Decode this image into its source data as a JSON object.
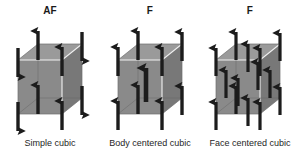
{
  "figure": {
    "background_color": "#ffffff",
    "width": 300,
    "height": 153
  },
  "style": {
    "cube_front_color": "#8a8a8a",
    "cube_side_color": "#787878",
    "cube_top_color": "#9a9a9a",
    "cube_edge_color": "#f2f2f2",
    "arrow_color": "#1c1c1c",
    "text_color": "#262626"
  },
  "cells": [
    {
      "id": "simple-cubic",
      "top_label": "AF",
      "bottom_label": "Simple cubic",
      "ordering": "antiferromagnetic",
      "site_count": 8,
      "sites": [
        {
          "name": "corner-front-bottom-left",
          "x": 18,
          "y": 98,
          "dir": "down",
          "size": "large"
        },
        {
          "name": "corner-front-bottom-right",
          "x": 62,
          "y": 98,
          "dir": "up",
          "size": "large"
        },
        {
          "name": "corner-front-top-left",
          "x": 18,
          "y": 44,
          "dir": "down",
          "size": "large"
        },
        {
          "name": "corner-front-top-right",
          "x": 62,
          "y": 44,
          "dir": "up",
          "size": "large"
        },
        {
          "name": "corner-back-bottom-left",
          "x": 38,
          "y": 82,
          "dir": "up",
          "size": "large"
        },
        {
          "name": "corner-back-bottom-right",
          "x": 82,
          "y": 82,
          "dir": "down",
          "size": "large"
        },
        {
          "name": "corner-back-top-left",
          "x": 38,
          "y": 28,
          "dir": "up",
          "size": "large"
        },
        {
          "name": "corner-back-top-right",
          "x": 82,
          "y": 28,
          "dir": "down",
          "size": "large"
        }
      ]
    },
    {
      "id": "body-centered-cubic",
      "top_label": "F",
      "bottom_label": "Body centered cubic",
      "ordering": "ferromagnetic",
      "site_count": 9,
      "sites": [
        {
          "name": "corner-front-bottom-left",
          "x": 18,
          "y": 98,
          "dir": "up",
          "size": "large"
        },
        {
          "name": "corner-front-bottom-right",
          "x": 62,
          "y": 98,
          "dir": "up",
          "size": "large"
        },
        {
          "name": "corner-front-top-left",
          "x": 18,
          "y": 44,
          "dir": "up",
          "size": "large"
        },
        {
          "name": "corner-front-top-right",
          "x": 62,
          "y": 44,
          "dir": "up",
          "size": "large"
        },
        {
          "name": "corner-back-bottom-left",
          "x": 38,
          "y": 82,
          "dir": "up",
          "size": "large"
        },
        {
          "name": "corner-back-bottom-right",
          "x": 82,
          "y": 82,
          "dir": "up",
          "size": "large"
        },
        {
          "name": "corner-back-top-left",
          "x": 38,
          "y": 28,
          "dir": "up",
          "size": "large"
        },
        {
          "name": "corner-back-top-right",
          "x": 82,
          "y": 28,
          "dir": "up",
          "size": "large"
        },
        {
          "name": "body-center",
          "x": 50,
          "y": 66,
          "dir": "up",
          "size": "large"
        }
      ]
    },
    {
      "id": "face-centered-cubic",
      "top_label": "F",
      "bottom_label": "Face centered cubic",
      "ordering": "ferromagnetic",
      "site_count": 14,
      "sites": [
        {
          "name": "corner-front-bottom-left",
          "x": 16,
          "y": 98,
          "dir": "up",
          "size": "large"
        },
        {
          "name": "corner-front-bottom-right",
          "x": 60,
          "y": 98,
          "dir": "up",
          "size": "large"
        },
        {
          "name": "corner-front-top-left",
          "x": 16,
          "y": 44,
          "dir": "up",
          "size": "large"
        },
        {
          "name": "corner-front-top-right",
          "x": 60,
          "y": 44,
          "dir": "up",
          "size": "large"
        },
        {
          "name": "corner-back-bottom-left",
          "x": 36,
          "y": 82,
          "dir": "up",
          "size": "large"
        },
        {
          "name": "corner-back-bottom-right",
          "x": 80,
          "y": 82,
          "dir": "up",
          "size": "large"
        },
        {
          "name": "corner-back-top-left",
          "x": 36,
          "y": 28,
          "dir": "up",
          "size": "large"
        },
        {
          "name": "corner-back-top-right",
          "x": 80,
          "y": 28,
          "dir": "up",
          "size": "large"
        },
        {
          "name": "face-center-front",
          "x": 38,
          "y": 71,
          "dir": "up",
          "size": "large"
        },
        {
          "name": "face-center-back",
          "x": 58,
          "y": 55,
          "dir": "up",
          "size": "large"
        },
        {
          "name": "face-center-left",
          "x": 26,
          "y": 63,
          "dir": "up",
          "size": "large"
        },
        {
          "name": "face-center-right",
          "x": 70,
          "y": 63,
          "dir": "up",
          "size": "large"
        },
        {
          "name": "face-center-top",
          "x": 48,
          "y": 36,
          "dir": "up",
          "size": "large"
        },
        {
          "name": "face-center-bottom",
          "x": 48,
          "y": 90,
          "dir": "up",
          "size": "large"
        }
      ]
    }
  ]
}
